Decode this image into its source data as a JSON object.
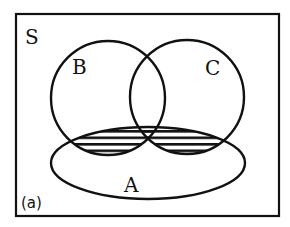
{
  "diagram": {
    "type": "venn",
    "universe_label": "S",
    "caption": "(a)",
    "sets": [
      {
        "id": "A",
        "label": "A",
        "shape": "ellipse"
      },
      {
        "id": "B",
        "label": "B",
        "shape": "circle"
      },
      {
        "id": "C",
        "label": "C",
        "shape": "circle"
      }
    ],
    "shaded_region": "A ∩ (B ∪ C)",
    "shading_style": "horizontal-hatch",
    "colors": {
      "stroke": "#111111",
      "background": "#ffffff"
    }
  }
}
